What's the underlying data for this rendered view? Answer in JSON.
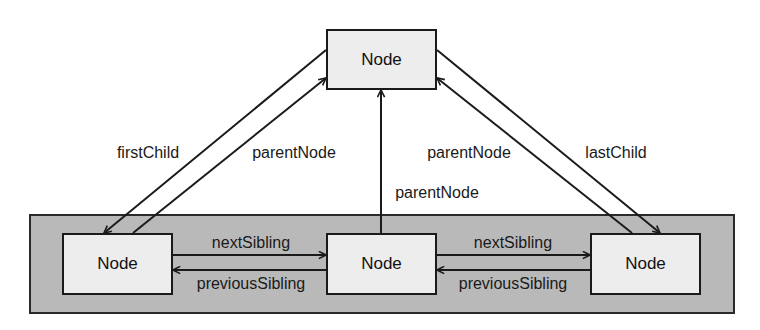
{
  "diagram": {
    "colors": {
      "line": "#1a1a1a",
      "node_fill": "#ededed",
      "container_fill": "#b9b9b9",
      "background": "#ffffff"
    },
    "container": {
      "x": 29,
      "y": 214,
      "w": 706,
      "h": 100
    },
    "nodes": [
      {
        "id": "parent",
        "label": "Node",
        "x": 326,
        "y": 29,
        "w": 111,
        "h": 61
      },
      {
        "id": "first",
        "label": "Node",
        "x": 62,
        "y": 233,
        "w": 111,
        "h": 62
      },
      {
        "id": "middle",
        "label": "Node",
        "x": 326,
        "y": 233,
        "w": 111,
        "h": 62
      },
      {
        "id": "last",
        "label": "Node",
        "x": 590,
        "y": 233,
        "w": 111,
        "h": 62
      }
    ],
    "edges": [
      {
        "id": "first-child",
        "label": "firstChild",
        "from": [
          326,
          50
        ],
        "to": [
          104,
          233
        ],
        "label_pos": [
          148,
          153
        ]
      },
      {
        "id": "parent-node-left",
        "label": "parentNode",
        "from": [
          133,
          233
        ],
        "to": [
          326,
          78
        ],
        "label_pos": [
          294,
          153
        ]
      },
      {
        "id": "parent-node-middle",
        "label": "parentNode",
        "from": [
          381,
          233
        ],
        "to": [
          381,
          90
        ],
        "label_pos": [
          437,
          193
        ]
      },
      {
        "id": "parent-node-right",
        "label": "parentNode",
        "from": [
          632,
          233
        ],
        "to": [
          437,
          78
        ],
        "label_pos": [
          469,
          153
        ]
      },
      {
        "id": "last-child",
        "label": "lastChild",
        "from": [
          437,
          50
        ],
        "to": [
          660,
          233
        ],
        "label_pos": [
          616,
          153
        ]
      },
      {
        "id": "next-sibling-1",
        "label": "nextSibling",
        "from": [
          173,
          255
        ],
        "to": [
          326,
          255
        ],
        "label_pos": [
          251,
          243
        ]
      },
      {
        "id": "previous-sibling-1",
        "label": "previousSibling",
        "from": [
          326,
          270
        ],
        "to": [
          173,
          270
        ],
        "label_pos": [
          251,
          284
        ]
      },
      {
        "id": "next-sibling-2",
        "label": "nextSibling",
        "from": [
          437,
          255
        ],
        "to": [
          590,
          255
        ],
        "label_pos": [
          513,
          243
        ]
      },
      {
        "id": "previous-sibling-2",
        "label": "previousSibling",
        "from": [
          590,
          270
        ],
        "to": [
          437,
          270
        ],
        "label_pos": [
          513,
          284
        ]
      }
    ]
  }
}
